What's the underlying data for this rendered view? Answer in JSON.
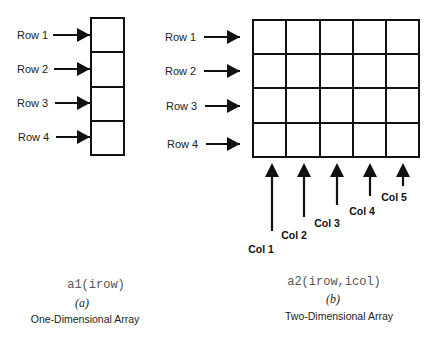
{
  "diagram_a": {
    "rows": [
      "Row 1",
      "Row 2",
      "Row 3",
      "Row 4"
    ],
    "expression": "a1(irow)",
    "tag": "(a)",
    "caption": "One-Dimensional Array"
  },
  "diagram_b": {
    "rows": [
      "Row 1",
      "Row 2",
      "Row 3",
      "Row 4"
    ],
    "cols": [
      "Col 1",
      "Col 2",
      "Col 3",
      "Col 4",
      "Col 5"
    ],
    "expression": "a2(irow,icol)",
    "tag": "(b)",
    "caption": "Two-Dimensional Array"
  },
  "colors": {
    "stroke": "#111111",
    "background": "#ffffff"
  }
}
